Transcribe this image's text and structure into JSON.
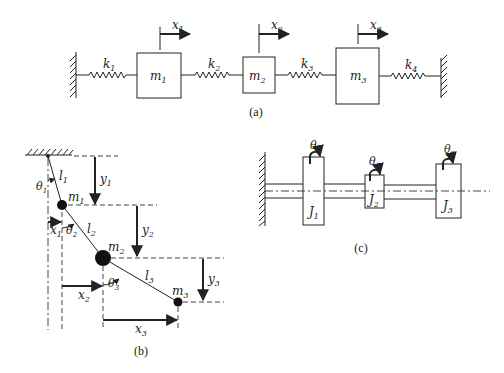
{
  "figure": {
    "panel_a": {
      "caption": "(a)",
      "springs": [
        {
          "label": "k",
          "sub": "1"
        },
        {
          "label": "k",
          "sub": "2"
        },
        {
          "label": "k",
          "sub": "3"
        },
        {
          "label": "k",
          "sub": "4"
        }
      ],
      "masses": [
        {
          "label": "m",
          "sub": "1"
        },
        {
          "label": "m",
          "sub": "2"
        },
        {
          "label": "m",
          "sub": "3"
        }
      ],
      "displacements": [
        {
          "label": "x",
          "sub": "1"
        },
        {
          "label": "x",
          "sub": "2"
        },
        {
          "label": "x",
          "sub": "3"
        }
      ]
    },
    "panel_b": {
      "caption": "(b)",
      "masses": [
        {
          "label": "m",
          "sub": "1"
        },
        {
          "label": "m",
          "sub": "2"
        },
        {
          "label": "m",
          "sub": "3"
        }
      ],
      "lengths": [
        {
          "label": "l",
          "sub": "1"
        },
        {
          "label": "l",
          "sub": "2"
        },
        {
          "label": "l",
          "sub": "3"
        }
      ],
      "angles": [
        {
          "label": "θ",
          "sub": "1"
        },
        {
          "label": "θ",
          "sub": "2"
        },
        {
          "label": "θ",
          "sub": "3"
        }
      ],
      "horizontal": [
        {
          "label": "x",
          "sub": "1"
        },
        {
          "label": "x",
          "sub": "2"
        },
        {
          "label": "x",
          "sub": "3"
        }
      ],
      "vertical": [
        {
          "label": "y",
          "sub": "1"
        },
        {
          "label": "y",
          "sub": "2"
        },
        {
          "label": "y",
          "sub": "3"
        }
      ]
    },
    "panel_c": {
      "caption": "(c)",
      "disks": [
        {
          "label": "J",
          "sub": "1"
        },
        {
          "label": "J",
          "sub": "2"
        },
        {
          "label": "J",
          "sub": "3"
        }
      ],
      "rotations": [
        {
          "label": "θ",
          "sub": "1"
        },
        {
          "label": "θ",
          "sub": "2"
        },
        {
          "label": "θ",
          "sub": "3"
        }
      ]
    }
  }
}
